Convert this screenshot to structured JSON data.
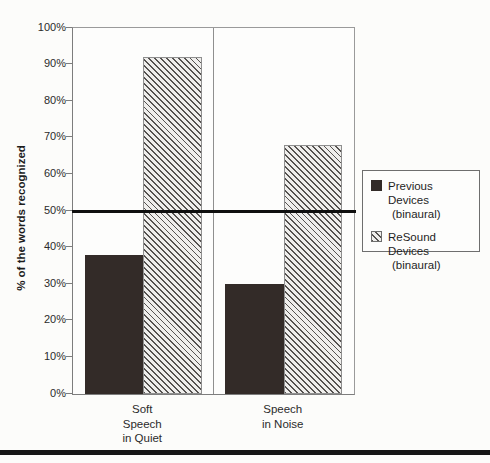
{
  "chart_data": {
    "type": "bar",
    "title": "",
    "xlabel": "",
    "ylabel": "% of the words recognized",
    "ylim": [
      0,
      100
    ],
    "ytick_labels": [
      "0%",
      "10%",
      "20%",
      "30%",
      "40%",
      "50%",
      "60%",
      "70%",
      "80%",
      "90%",
      "100%"
    ],
    "categories": [
      [
        "Soft",
        "Speech",
        "in Quiet"
      ],
      [
        "Speech",
        "in Noise"
      ]
    ],
    "series": [
      {
        "name": "Previous Devices",
        "sub": "(binaural)",
        "values": [
          38,
          30
        ],
        "style": "solid",
        "color": "#332b28"
      },
      {
        "name": "ReSound Devices",
        "sub": "(binaural)",
        "values": [
          92,
          68
        ],
        "style": "hatched",
        "hatch_color": "#555250",
        "hatch_bg": "#efeeec"
      }
    ],
    "reference_line": {
      "value": 50,
      "color": "#0f0f0f"
    },
    "legend_position": "right",
    "grid": false
  },
  "colors": {
    "page_background": "#fcfcfa",
    "axis": "#7d7d7d",
    "bottom_rule": "#161616"
  }
}
